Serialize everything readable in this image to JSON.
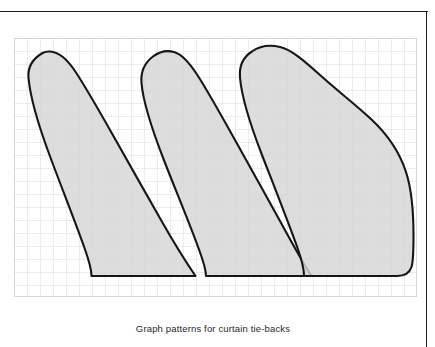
{
  "figure": {
    "caption": "Graph patterns for curtain tie-backs",
    "title": "Graph patterns for curtain tie-backs",
    "kind": "pattern-drafting-diagram",
    "colors": {
      "page_background": "#ffffff",
      "frame_rule": "#1c1c1c",
      "grid_line": "#cfcfcf",
      "shape_fill": "#d6d6d6",
      "shape_outline": "#161616",
      "caption_text": "#1f1f1f"
    }
  },
  "grid": {
    "label": "graph-paper-grid",
    "cell_size_px": 13,
    "columns": 31,
    "rows": 20,
    "x0": 0,
    "y0": 0,
    "width": 403,
    "height": 259,
    "line_width": 0.8,
    "visible": true
  },
  "chart_data": {
    "type": "scatter",
    "title": "Graph patterns for curtain tie-backs",
    "xlabel": "",
    "ylabel": "",
    "grid": true,
    "legend": false,
    "note": "Three curtain tie-back pattern outlines plotted on a square grid; coordinates are in grid squares measured from the top-left corner of the grid.",
    "axis_units": "grid squares (13 px each)",
    "xlim": [
      0,
      31
    ],
    "ylim": [
      0,
      20
    ],
    "series": [
      {
        "name": "Pattern 1 - narrow tie-back",
        "outline_grid_points": [
          [
            1.1,
            1.9
          ],
          [
            1.0,
            3.0
          ],
          [
            1.3,
            4.6
          ],
          [
            2.6,
            8.4
          ],
          [
            4.2,
            12.6
          ],
          [
            5.2,
            15.2
          ],
          [
            5.9,
            17.1
          ],
          [
            5.9,
            18.3
          ],
          [
            13.9,
            18.3
          ],
          [
            13.0,
            16.6
          ],
          [
            11.2,
            13.3
          ],
          [
            9.0,
            9.3
          ],
          [
            7.3,
            6.2
          ],
          [
            5.8,
            3.6
          ],
          [
            4.6,
            1.9
          ],
          [
            3.4,
            1.1
          ],
          [
            2.2,
            1.1
          ]
        ],
        "bottom_edge_y_grid": 18.3,
        "tip_apex_grid": [
          2.6,
          1.05
        ],
        "width_grid": 12.9,
        "height_grid": 17.3
      },
      {
        "name": "Pattern 2 - medium tie-back",
        "outline_grid_points": [
          [
            10.0,
            2.0
          ],
          [
            9.8,
            3.4
          ],
          [
            10.3,
            5.6
          ],
          [
            11.6,
            9.3
          ],
          [
            13.1,
            13.1
          ],
          [
            14.3,
            16.1
          ],
          [
            14.8,
            17.6
          ],
          [
            14.8,
            18.3
          ],
          [
            22.9,
            18.3
          ],
          [
            22.2,
            16.6
          ],
          [
            20.2,
            12.6
          ],
          [
            18.0,
            8.6
          ],
          [
            16.1,
            5.4
          ],
          [
            14.5,
            3.1
          ],
          [
            13.2,
            1.4
          ],
          [
            11.9,
            1.05
          ],
          [
            10.8,
            1.3
          ]
        ],
        "bottom_edge_y_grid": 18.3,
        "tip_apex_grid": [
          11.8,
          1.05
        ],
        "width_grid": 13.1,
        "height_grid": 17.3
      },
      {
        "name": "Pattern 3 - wide flared tie-back",
        "outline_grid_points": [
          [
            17.6,
            1.7
          ],
          [
            17.4,
            3.1
          ],
          [
            17.9,
            5.3
          ],
          [
            19.2,
            9.0
          ],
          [
            20.7,
            12.8
          ],
          [
            22.1,
            16.2
          ],
          [
            22.8,
            17.9
          ],
          [
            22.8,
            18.3
          ],
          [
            30.0,
            18.3
          ],
          [
            30.5,
            18.0
          ],
          [
            30.6,
            17.2
          ],
          [
            30.6,
            14.2
          ],
          [
            30.2,
            11.5
          ],
          [
            29.1,
            9.0
          ],
          [
            27.3,
            6.8
          ],
          [
            25.1,
            5.0
          ],
          [
            23.0,
            3.2
          ],
          [
            21.3,
            1.5
          ],
          [
            19.8,
            0.85
          ],
          [
            18.5,
            1.0
          ]
        ],
        "bottom_edge_y_grid": 18.3,
        "tip_apex_grid": [
          19.5,
          0.85
        ],
        "width_grid": 13.2,
        "height_grid": 17.5
      }
    ]
  },
  "shapes": [
    {
      "id": "tie-back-pattern-1",
      "label": "Pattern 1",
      "path": "M 28.5,15.0 C 20.0,20.0 13.5,27.5 14.5,39.5 C 16.0,57.5 24.0,86.0 35.5,117.0 C 47.0,148.0 60.5,182.0 70.5,210.0 C 75.5,224.0 77.5,232.5 77.5,238.0 L 181.5,238.0 C 174.0,227.0 160.0,205.0 147.0,182.0 C 131.0,154.0 113.0,122.0 98.0,95.5 C 83.0,69.0 71.0,48.0 61.0,33.0 C 52.0,19.5 44.0,14.0 36.0,13.5 C 33.0,13.3 30.5,13.9 28.5,15.0 Z"
    },
    {
      "id": "tie-back-pattern-2",
      "label": "Pattern 2",
      "path": "M 139.0,18.5 C 131.0,24.5 126.5,33.0 127.5,45.0 C 129.0,63.0 137.5,90.0 149.5,121.0 C 161.5,152.0 175.0,184.0 185.0,211.5 C 190.0,225.0 192.0,233.0 192.0,238.0 L 297.5,238.0 C 291.0,228.0 278.5,206.0 266.0,183.0 C 250.5,155.0 233.0,123.5 218.5,97.5 C 204.0,71.5 192.5,51.0 183.0,36.5 C 174.5,23.5 167.5,16.0 160.0,14.0 C 152.5,12.0 145.0,14.0 139.0,18.5 Z"
    },
    {
      "id": "tie-back-pattern-3",
      "label": "Pattern 3",
      "path": "M 238.0,13.5 C 230.0,18.5 225.0,27.0 226.0,39.5 C 227.5,57.5 236.0,86.0 248.0,117.0 C 260.0,148.0 273.5,182.0 283.5,210.0 C 288.0,222.5 290.0,231.5 290.0,238.0 L 383.0,238.0 C 390.0,238.0 395.5,235.0 397.5,229.0 C 399.5,223.0 399.5,213.0 399.5,197.5 C 399.5,173.0 398.0,152.5 392.0,134.0 C 385.5,114.0 374.0,97.0 357.5,81.5 C 341.0,66.0 322.5,52.0 306.0,37.0 C 289.5,22.0 277.0,11.5 266.0,9.0 C 255.5,6.5 245.0,8.5 238.0,13.5 Z"
    }
  ]
}
